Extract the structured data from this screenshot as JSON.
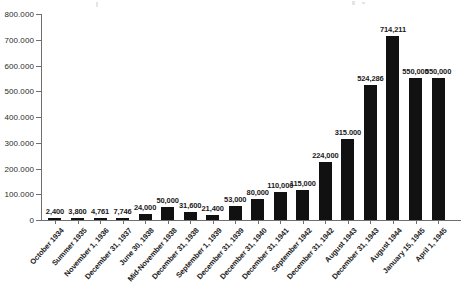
{
  "chart_data": {
    "type": "bar",
    "title": "",
    "subtitle": "",
    "xlabel": "",
    "ylabel": "",
    "ylim": [
      0,
      800000
    ],
    "grid": false,
    "legend": null,
    "y_tick_labels": [
      "800.000",
      "700.000",
      "600.000",
      "500.000",
      "400.000",
      "300.000",
      "200.000",
      "100.000",
      "0"
    ],
    "y_tick_values": [
      800000,
      700000,
      600000,
      500000,
      400000,
      300000,
      200000,
      100000,
      0
    ],
    "categories": [
      "October 1934",
      "Summer 1935",
      "November 1, 1936",
      "December 31, 1937",
      "June 30, 1938",
      "Mid-November 1938",
      "December 31, 1938",
      "September 1, 1939",
      "December 31, 1939",
      "December 31, 1940",
      "December 31, 1941",
      "September 1942",
      "December 31, 1942",
      "August 1943",
      "December 31, 1943",
      "August 1944",
      "January 15, 1945",
      "April 1, 1945"
    ],
    "values": [
      2400,
      3800,
      4761,
      7746,
      24000,
      50000,
      31600,
      21400,
      53000,
      80000,
      110000,
      115000,
      224000,
      315000,
      524286,
      714211,
      550000,
      550000
    ],
    "value_labels": [
      "2,400",
      "3,800",
      "4,761",
      "7,746",
      "24,000",
      "50,000",
      "31,600",
      "21,400",
      "53,000",
      "80,000",
      "110,000",
      "115,000",
      "224,000",
      "315.000",
      "524,286",
      "714,211",
      "550,000",
      "550,000"
    ],
    "bar_color": "#111111",
    "axis_color": "#6f6f6f",
    "background_color": "#ffffff"
  }
}
